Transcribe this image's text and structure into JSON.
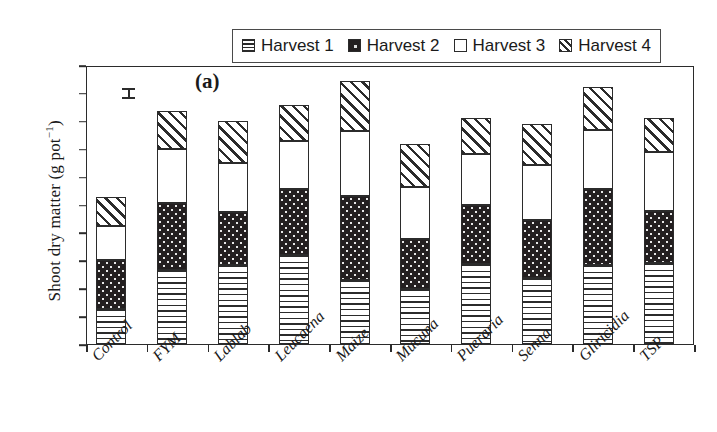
{
  "panel": {
    "label": "(a)"
  },
  "axes": {
    "y_title_main": "Shoot dry matter (g pot",
    "y_title_sup": "−1",
    "y_title_close": ")",
    "y_ticks": [
      0,
      5,
      10,
      15,
      20,
      25,
      30,
      35,
      40,
      45,
      50
    ],
    "y_min": 0,
    "y_max": 50
  },
  "legend": {
    "entries": [
      {
        "label": "Harvest 1",
        "pattern": "horizontal-lines"
      },
      {
        "label": "Harvest 2",
        "pattern": "dark-dotted"
      },
      {
        "label": "Harvest 3",
        "pattern": "white"
      },
      {
        "label": "Harvest 4",
        "pattern": "diagonal-hatch"
      }
    ]
  },
  "error_bar": {
    "name": "lsd-error-bar",
    "value_center": 45.0
  },
  "chart_data": {
    "type": "bar",
    "subtype": "stacked-bar",
    "title": "(a)",
    "xlabel": "",
    "ylabel": "Shoot dry matter (g pot−1)",
    "ylim": [
      0,
      50
    ],
    "ytick_step": 5,
    "grid": false,
    "legend_position": "top-center",
    "categories": [
      "Control",
      "FYM",
      "Lablab",
      "Leucaena",
      "Maize",
      "Mucuna",
      "Pueraria",
      "Senna",
      "Gliricidia",
      "TSP"
    ],
    "series": [
      {
        "name": "Harvest 1",
        "pattern": "horizontal-lines",
        "values": [
          6.2,
          13.3,
          14.2,
          15.9,
          11.5,
          9.8,
          14.4,
          11.9,
          14.2,
          14.5
        ]
      },
      {
        "name": "Harvest 2",
        "pattern": "dark-dotted",
        "values": [
          8.9,
          11.9,
          9.4,
          11.9,
          15.0,
          9.0,
          10.5,
          10.4,
          13.6,
          9.4
        ]
      },
      {
        "name": "Harvest 3",
        "pattern": "white",
        "values": [
          6.1,
          9.7,
          8.8,
          8.6,
          11.7,
          9.4,
          9.2,
          9.7,
          10.5,
          10.5
        ]
      },
      {
        "name": "Harvest 4",
        "pattern": "diagonal-hatch",
        "values": [
          5.2,
          6.8,
          7.6,
          6.4,
          9.0,
          7.6,
          6.4,
          7.5,
          7.8,
          6.1
        ]
      }
    ],
    "cumulative_tops": [
      {
        "category": "Control",
        "h1": 6.2,
        "h2": 15.1,
        "h3": 21.2,
        "h4": 26.4
      },
      {
        "category": "FYM",
        "h1": 13.3,
        "h2": 25.2,
        "h3": 34.9,
        "h4": 41.7
      },
      {
        "category": "Lablab",
        "h1": 14.2,
        "h2": 23.6,
        "h3": 32.4,
        "h4": 40.0
      },
      {
        "category": "Leucaena",
        "h1": 15.9,
        "h2": 27.8,
        "h3": 36.4,
        "h4": 42.8
      },
      {
        "category": "Maize",
        "h1": 11.5,
        "h2": 26.5,
        "h3": 38.2,
        "h4": 47.2
      },
      {
        "category": "Mucuna",
        "h1": 9.8,
        "h2": 18.8,
        "h3": 28.2,
        "h4": 35.8
      },
      {
        "category": "Pueraria",
        "h1": 14.4,
        "h2": 24.9,
        "h3": 34.1,
        "h4": 40.5
      },
      {
        "category": "Senna",
        "h1": 11.9,
        "h2": 22.3,
        "h3": 32.0,
        "h4": 39.5
      },
      {
        "category": "Gliricidia",
        "h1": 14.2,
        "h2": 27.8,
        "h3": 38.3,
        "h4": 46.1
      },
      {
        "category": "TSP",
        "h1": 14.5,
        "h2": 23.9,
        "h3": 34.4,
        "h4": 40.5
      }
    ],
    "totals": [
      26.4,
      41.7,
      40.0,
      42.8,
      47.2,
      35.8,
      40.5,
      39.5,
      46.1,
      40.5
    ]
  }
}
